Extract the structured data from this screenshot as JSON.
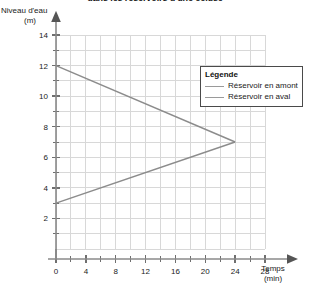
{
  "chart_data": {
    "type": "line",
    "title": "dans les réservoirs d'une écluse",
    "xlabel": "Temps",
    "xunit": "(min)",
    "ylabel": "Niveau d'eau",
    "yunit": "(m)",
    "xlim": [
      0,
      28
    ],
    "ylim": [
      0,
      14
    ],
    "xticks": [
      0,
      4,
      8,
      12,
      16,
      20,
      24,
      28
    ],
    "xtick_labels": [
      "0",
      "4",
      "8",
      "12",
      "16",
      "20",
      "24",
      "28"
    ],
    "yticks": [
      2,
      4,
      6,
      8,
      10,
      12,
      14
    ],
    "ytick_labels": [
      "2",
      "4",
      "6",
      "8",
      "10",
      "12",
      "14"
    ],
    "x_minor_step": 2,
    "y_minor_step": 1,
    "grid": true,
    "grid_color": "#d8d8d8",
    "axis_color": "#8a8a8a",
    "legend_position": "top-right",
    "series": [
      {
        "name": "Réservoir en amont",
        "color": "#8c8c8c",
        "points": [
          [
            0,
            12
          ],
          [
            24,
            7
          ]
        ]
      },
      {
        "name": "Réservoir en aval",
        "color": "#8c8c8c",
        "points": [
          [
            0,
            3
          ],
          [
            24,
            7
          ]
        ]
      }
    ]
  },
  "legend": {
    "title": "Légende",
    "entries": [
      {
        "label": "Réservoir en amont"
      },
      {
        "label": "Réservoir en aval"
      }
    ]
  }
}
